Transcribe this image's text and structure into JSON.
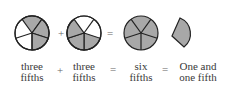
{
  "diagram": {
    "shade_color": "#a8a8a8",
    "stroke_color": "#222222",
    "figures": [
      {
        "name": "three-fifths-a",
        "shaded_sectors": [
          0,
          1,
          2
        ]
      },
      {
        "name": "three-fifths-b",
        "shaded_sectors": [
          2,
          3,
          4
        ]
      },
      {
        "name": "six-fifths-whole",
        "shaded_sectors": [
          0,
          1,
          2,
          3,
          4
        ]
      },
      {
        "name": "one-fifth-wedge",
        "shaded_sectors": [
          0
        ]
      }
    ],
    "operators": {
      "plus_top": "+",
      "equals_top": "=",
      "plus_bottom": "+",
      "equals_bottom_1": "=",
      "equals_bottom_2": "="
    },
    "labels": {
      "term1_line1": "three",
      "term1_line2": "fifths",
      "term2_line1": "three",
      "term2_line2": "fifths",
      "sum_line1": "six",
      "sum_line2": "fifths",
      "result_line1": "One and",
      "result_line2": "one fifth"
    }
  }
}
